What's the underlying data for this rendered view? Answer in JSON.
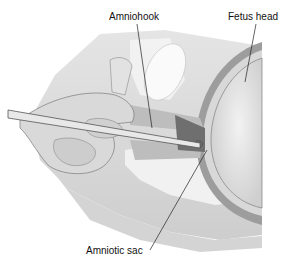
{
  "diagram": {
    "labels": [
      {
        "id": "amniohook",
        "text": "Amniohook"
      },
      {
        "id": "fetus-head",
        "text": "Fetus head"
      },
      {
        "id": "amniotic-sac",
        "text": "Amniotic sac"
      }
    ]
  },
  "colors": {
    "background": "#ffffff",
    "line": "#222222",
    "tissue_light": "#e6e6e6",
    "tissue_mid": "#c8c8c8",
    "tissue_dark": "#9a9a9a"
  }
}
